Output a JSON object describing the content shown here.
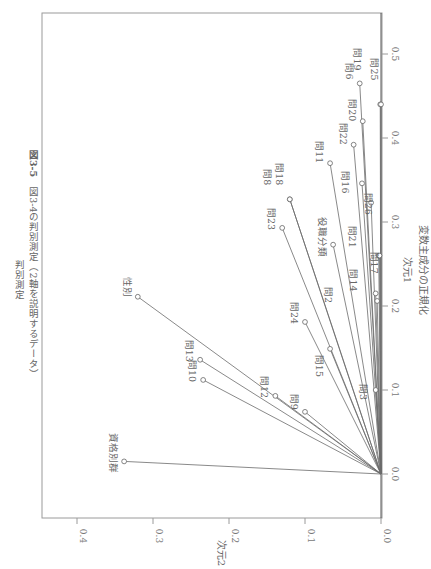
{
  "title": {
    "figure_number": "図3-5",
    "caption": "図3-4の判別測定（2軸を説明するデータ）",
    "subtitle": "判別測定"
  },
  "chart_data": {
    "type": "scatter",
    "variant": "biplot-vectors-from-origin",
    "orientation": "rotated 90° clockwise",
    "title": "図3-4の判別測定（2軸を説明するデータ） 判別測定",
    "xlabel": "次元1",
    "xlabel_sub": "変数主成分の正規化",
    "ylabel": "次元2",
    "xlim": [
      0.0,
      0.55
    ],
    "ylim": [
      0.0,
      0.45
    ],
    "xticks": [
      0.0,
      0.1,
      0.2,
      0.3,
      0.4,
      0.5
    ],
    "yticks": [
      0.0,
      0.1,
      0.2,
      0.3,
      0.4
    ],
    "grid": false,
    "points": [
      {
        "label": "資格別群",
        "dim1": 0.015,
        "dim2": 0.338
      },
      {
        "label": "性別",
        "dim1": 0.211,
        "dim2": 0.32
      },
      {
        "label": "問13",
        "dim1": 0.136,
        "dim2": 0.238
      },
      {
        "label": "問10",
        "dim1": 0.112,
        "dim2": 0.234
      },
      {
        "label": "問12",
        "dim1": 0.093,
        "dim2": 0.139
      },
      {
        "label": "問9",
        "dim1": 0.074,
        "dim2": 0.1
      },
      {
        "label": "問15",
        "dim1": 0.149,
        "dim2": 0.067
      },
      {
        "label": "問24",
        "dim1": 0.181,
        "dim2": 0.1
      },
      {
        "label": "問23",
        "dim1": 0.293,
        "dim2": 0.13
      },
      {
        "label": "問8",
        "dim1": 0.327,
        "dim2": 0.12
      },
      {
        "label": "問18",
        "dim1": 0.327,
        "dim2": 0.12
      },
      {
        "label": "役職分類",
        "dim1": 0.273,
        "dim2": 0.063
      },
      {
        "label": "問11",
        "dim1": 0.37,
        "dim2": 0.067
      },
      {
        "label": "問22",
        "dim1": 0.392,
        "dim2": 0.036
      },
      {
        "label": "問16",
        "dim1": 0.346,
        "dim2": 0.025
      },
      {
        "label": "問26",
        "dim1": 0.323,
        "dim2": 0.013
      },
      {
        "label": "問20",
        "dim1": 0.42,
        "dim2": 0.024
      },
      {
        "label": "問6",
        "dim1": 0.465,
        "dim2": 0.028
      },
      {
        "label": "問19",
        "dim1": 0.44,
        "dim2": 0.001
      },
      {
        "label": "問25",
        "dim1": 0.44,
        "dim2": 0.0
      },
      {
        "label": "問21",
        "dim1": 0.26,
        "dim2": 0.003
      },
      {
        "label": "問17",
        "dim1": 0.26,
        "dim2": 0.002
      },
      {
        "label": "問14",
        "dim1": 0.215,
        "dim2": 0.007
      },
      {
        "label": "問2",
        "dim1": 0.206,
        "dim2": 0.005
      },
      {
        "label": "問3",
        "dim1": 0.1,
        "dim2": 0.007
      }
    ]
  },
  "labels_layout": [
    {
      "label": "資格別群",
      "dx": -14,
      "dy": -28
    },
    {
      "label": "性別",
      "dx": -14,
      "dy": -20
    },
    {
      "label": "問13",
      "dx": -14,
      "dy": -20
    },
    {
      "label": "問10",
      "dx": -14,
      "dy": -20
    },
    {
      "label": "問12",
      "dx": -14,
      "dy": -20
    },
    {
      "label": "問9",
      "dx": -14,
      "dy": -18
    },
    {
      "label": "問15",
      "dx": -14,
      "dy": 6
    },
    {
      "label": "問24",
      "dx": -14,
      "dy": -20
    },
    {
      "label": "問23",
      "dx": -14,
      "dy": -20
    },
    {
      "label": "問8",
      "dx": -26,
      "dy": -30
    },
    {
      "label": "問18",
      "dx": -14,
      "dy": -36
    },
    {
      "label": "役職分類",
      "dx": -14,
      "dy": -28
    },
    {
      "label": "問11",
      "dx": -14,
      "dy": -22
    },
    {
      "label": "問22",
      "dx": -14,
      "dy": -22
    },
    {
      "label": "問16",
      "dx": -20,
      "dy": -12
    },
    {
      "label": "問26",
      "dx": -6,
      "dy": -10
    },
    {
      "label": "問20",
      "dx": -14,
      "dy": -22
    },
    {
      "label": "問6",
      "dx": -14,
      "dy": -20
    },
    {
      "label": "問19",
      "dx": -26,
      "dy": -56
    },
    {
      "label": "問25",
      "dx": -10,
      "dy": -46
    },
    {
      "label": "問21",
      "dx": -30,
      "dy": -30
    },
    {
      "label": "問17",
      "dx": -8,
      "dy": -4
    },
    {
      "label": "問14",
      "dx": -26,
      "dy": -24
    },
    {
      "label": "問2",
      "dx": -52,
      "dy": -14
    },
    {
      "label": "問3",
      "dx": -16,
      "dy": -6
    }
  ]
}
